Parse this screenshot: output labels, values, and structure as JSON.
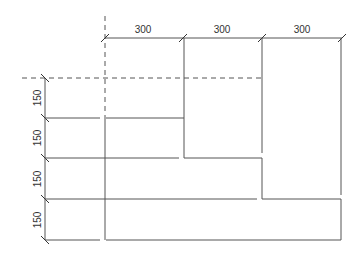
{
  "diagram": {
    "type": "dimensioned-drawing",
    "stroke_color": "#555555",
    "background": "#ffffff",
    "horizontal_dimensions": [
      {
        "label": "300"
      },
      {
        "label": "300"
      },
      {
        "label": "300"
      }
    ],
    "vertical_dimensions": [
      {
        "label": "150"
      },
      {
        "label": "150"
      },
      {
        "label": "150"
      },
      {
        "label": "150"
      }
    ]
  }
}
